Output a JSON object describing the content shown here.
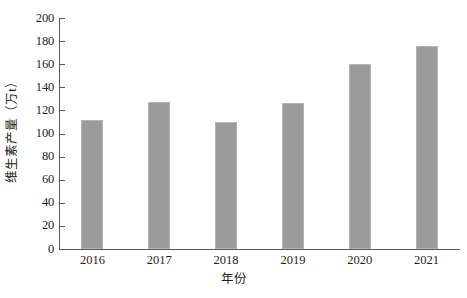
{
  "chart_data": {
    "type": "bar",
    "title": "",
    "subtitle": "",
    "xlabel": "年份",
    "ylabel": "维生素产量（万t）",
    "categories": [
      "2016",
      "2017",
      "2018",
      "2019",
      "2020",
      "2021"
    ],
    "values": [
      112,
      127,
      110,
      126,
      160,
      176
    ],
    "ylim": [
      0,
      200
    ],
    "yticks": [
      0,
      20,
      40,
      60,
      80,
      100,
      120,
      140,
      160,
      180,
      200
    ],
    "ytick_labels": [
      "0",
      "20",
      "40",
      "60",
      "80",
      "100",
      "120",
      "140",
      "160",
      "180",
      "200"
    ],
    "grid": false,
    "legend": false,
    "legend_position": "none",
    "series": [
      {
        "name": "维生素产量",
        "values": [
          112,
          127,
          110,
          126,
          160,
          176
        ]
      }
    ],
    "colors": {
      "bar_fill": "#9b9b9b",
      "bar_edge": "#b4b4b4",
      "axis": "#58595b",
      "text": "#231f20",
      "background": "#ffffff"
    }
  }
}
